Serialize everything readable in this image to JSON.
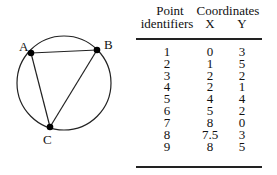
{
  "diagram": {
    "shape": "circle with inscribed triangle",
    "points": [
      {
        "label": "A"
      },
      {
        "label": "B"
      },
      {
        "label": "C"
      }
    ]
  },
  "table": {
    "headers": {
      "col1_line1": "Point",
      "col1_line2": "identifiers",
      "group": "Coordinates",
      "x": "X",
      "y": "Y"
    },
    "rows": [
      {
        "id": "1",
        "x": "0",
        "y": "3"
      },
      {
        "id": "2",
        "x": "1",
        "y": "5"
      },
      {
        "id": "3",
        "x": "2",
        "y": "2"
      },
      {
        "id": "4",
        "x": "2",
        "y": "1"
      },
      {
        "id": "5",
        "x": "4",
        "y": "4"
      },
      {
        "id": "6",
        "x": "5",
        "y": "2"
      },
      {
        "id": "7",
        "x": "8",
        "y": "0"
      },
      {
        "id": "8",
        "x": "7.5",
        "y": "3"
      },
      {
        "id": "9",
        "x": "8",
        "y": "5"
      }
    ]
  }
}
